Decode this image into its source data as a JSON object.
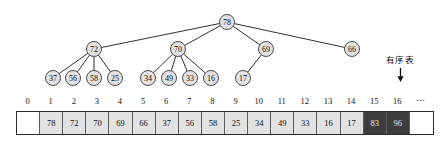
{
  "diagram": {
    "annotation": {
      "label": "有序表",
      "arrow_icon": "down-arrow-icon",
      "points_to_index": 15
    },
    "colors": {
      "node_fill": "#e2e2e2",
      "node_stroke": "#3b3b3b",
      "cell_fill": "#e2e2e2",
      "cell_sorted_fill": "#3d3d3d",
      "cell_empty_fill": "#ffffff",
      "text": "#111111"
    },
    "tree": {
      "root": {
        "value": "78",
        "cx": 227,
        "cy": 22,
        "r": 7.5
      },
      "level2": [
        {
          "value": "72",
          "cx": 94,
          "cy": 49,
          "r": 7.5
        },
        {
          "value": "70",
          "cx": 178,
          "cy": 49,
          "r": 7.5
        },
        {
          "value": "69",
          "cx": 266,
          "cy": 49,
          "r": 7.5
        },
        {
          "value": "66",
          "cx": 352,
          "cy": 49,
          "r": 7.5
        }
      ],
      "level3": [
        {
          "value": "37",
          "cx": 53,
          "cy": 78,
          "r": 7.5,
          "parent": 0
        },
        {
          "value": "56",
          "cx": 73,
          "cy": 78,
          "r": 7.5,
          "parent": 0
        },
        {
          "value": "58",
          "cx": 94,
          "cy": 78,
          "r": 7.5,
          "parent": 0
        },
        {
          "value": "25",
          "cx": 115,
          "cy": 78,
          "r": 7.5,
          "parent": 0
        },
        {
          "value": "34",
          "cx": 148,
          "cy": 78,
          "r": 7.5,
          "parent": 1
        },
        {
          "value": "49",
          "cx": 169,
          "cy": 78,
          "r": 7.5,
          "parent": 1
        },
        {
          "value": "33",
          "cx": 190,
          "cy": 78,
          "r": 7.5,
          "parent": 1
        },
        {
          "value": "16",
          "cx": 211,
          "cy": 78,
          "r": 7.5,
          "parent": 1
        },
        {
          "value": "17",
          "cx": 243,
          "cy": 78,
          "r": 7.5,
          "parent": 2
        }
      ]
    },
    "array": {
      "indices": [
        "0",
        "1",
        "2",
        "3",
        "4",
        "5",
        "6",
        "7",
        "8",
        "9",
        "10",
        "11",
        "12",
        "13",
        "14",
        "15",
        "16",
        "⋯"
      ],
      "cells": [
        {
          "value": "",
          "state": "empty"
        },
        {
          "value": "78",
          "state": "normal"
        },
        {
          "value": "72",
          "state": "normal"
        },
        {
          "value": "70",
          "state": "normal"
        },
        {
          "value": "69",
          "state": "normal"
        },
        {
          "value": "66",
          "state": "normal"
        },
        {
          "value": "37",
          "state": "normal"
        },
        {
          "value": "56",
          "state": "normal"
        },
        {
          "value": "58",
          "state": "normal"
        },
        {
          "value": "25",
          "state": "normal"
        },
        {
          "value": "34",
          "state": "normal"
        },
        {
          "value": "49",
          "state": "normal"
        },
        {
          "value": "33",
          "state": "normal"
        },
        {
          "value": "16",
          "state": "normal"
        },
        {
          "value": "17",
          "state": "normal"
        },
        {
          "value": "83",
          "state": "dark"
        },
        {
          "value": "96",
          "state": "dark"
        },
        {
          "value": "",
          "state": "empty"
        }
      ]
    }
  }
}
